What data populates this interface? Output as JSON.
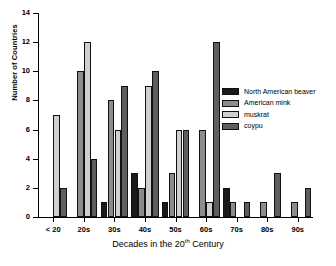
{
  "chart_data": {
    "type": "bar",
    "title": "",
    "xlabel": "Decades in the 20th Century",
    "xlabel_prefix": "Decades in the 20",
    "xlabel_superscript": "th",
    "xlabel_suffix": "Century",
    "ylabel": "Number of Countries",
    "categories": [
      "< 20",
      "20s",
      "30s",
      "40s",
      "50s",
      "60s",
      "70s",
      "80s",
      "90s"
    ],
    "ylim": [
      0,
      14
    ],
    "yticks": [
      0,
      2,
      4,
      6,
      8,
      10,
      12,
      14
    ],
    "grid": false,
    "legend_position": "inside-right",
    "series": [
      {
        "name": "North American beaver",
        "color": "#1a1a1a",
        "values": [
          0,
          0,
          1,
          3,
          1,
          0,
          2,
          0,
          0
        ]
      },
      {
        "name": "American mink",
        "color": "#8c8c8c",
        "values": [
          0,
          10,
          8,
          2,
          3,
          6,
          1,
          1,
          1
        ]
      },
      {
        "name": "muskrat",
        "color": "#cfcfcf",
        "values": [
          7,
          12,
          6,
          9,
          6,
          1,
          0,
          0,
          0
        ]
      },
      {
        "name": "coypu",
        "color": "#5e5e5e",
        "values": [
          2,
          4,
          9,
          10,
          6,
          12,
          1,
          3,
          2
        ]
      }
    ]
  }
}
